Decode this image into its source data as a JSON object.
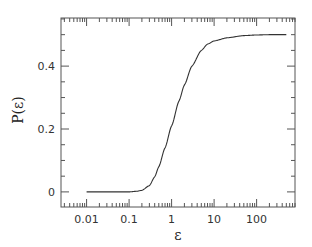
{
  "chart_data": {
    "type": "line",
    "title": "",
    "xlabel": "ε",
    "ylabel": "P(ε)",
    "xscale": "log",
    "xlim": [
      0.0025,
      800
    ],
    "ylim": [
      -0.048,
      0.553
    ],
    "grid": false,
    "legend": null,
    "x_ticks": [
      0.01,
      0.1,
      1,
      10,
      100
    ],
    "x_tick_labels": [
      "0.01",
      "0.1",
      "1",
      "10",
      "100"
    ],
    "y_ticks": [
      0,
      0.2,
      0.4
    ],
    "y_tick_labels": [
      "0",
      "0.2",
      "0.4"
    ],
    "series": [
      {
        "name": "P(ε)",
        "color": "#333333",
        "x": [
          0.01,
          0.03,
          0.1,
          0.15,
          0.2,
          0.3,
          0.4,
          0.5,
          0.7,
          1,
          1.5,
          2,
          3,
          5,
          7,
          10,
          20,
          50,
          100,
          200,
          500
        ],
        "y": [
          0,
          0,
          0,
          0.002,
          0.005,
          0.02,
          0.048,
          0.08,
          0.14,
          0.21,
          0.29,
          0.34,
          0.4,
          0.45,
          0.47,
          0.48,
          0.49,
          0.497,
          0.499,
          0.5,
          0.5
        ]
      }
    ]
  }
}
